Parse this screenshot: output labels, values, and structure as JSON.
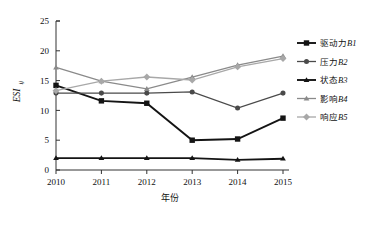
{
  "chart_data": {
    "type": "line",
    "title": "",
    "xlabel": "年份",
    "ylabel": "ESI",
    "ylabel_sub": "ij",
    "categories": [
      "2010",
      "2011",
      "2012",
      "2013",
      "2014",
      "2015"
    ],
    "xlim": [
      2010,
      2015
    ],
    "ylim": [
      0,
      25
    ],
    "yticks": [
      "0",
      "5",
      "10",
      "15",
      "20",
      "25"
    ],
    "ytick_values": [
      0,
      5,
      10,
      15,
      20,
      25
    ],
    "grid": false,
    "legend_position": "right",
    "series": [
      {
        "name": "驱动力B1",
        "label_cn": "驱动力",
        "label_code": "B1",
        "marker": "square",
        "color": "#141414",
        "values": [
          14.2,
          11.6,
          11.2,
          5.0,
          5.2,
          8.7
        ]
      },
      {
        "name": "压力B2",
        "label_cn": "压力",
        "label_code": "B2",
        "marker": "circle",
        "color": "#4a4a4a",
        "values": [
          12.9,
          12.9,
          12.9,
          13.1,
          10.4,
          12.9
        ]
      },
      {
        "name": "状态B3",
        "label_cn": "状态",
        "label_code": "B3",
        "marker": "triangle",
        "color": "#141414",
        "values": [
          2.0,
          2.0,
          2.0,
          2.0,
          1.7,
          1.9
        ]
      },
      {
        "name": "影响B4",
        "label_cn": "影响",
        "label_code": "B4",
        "marker": "triangle",
        "color": "#8a8a8a",
        "values": [
          17.2,
          14.9,
          13.6,
          15.6,
          17.6,
          19.1
        ]
      },
      {
        "name": "响应B5",
        "label_cn": "响应",
        "label_code": "B5",
        "marker": "diamond",
        "color": "#a8a8a8",
        "values": [
          13.3,
          14.9,
          15.6,
          15.1,
          17.3,
          18.7
        ]
      }
    ]
  }
}
